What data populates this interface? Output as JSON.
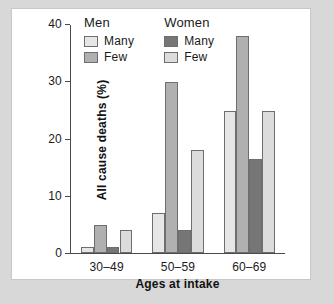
{
  "chart_data": {
    "type": "bar",
    "title": "",
    "subtitle": "",
    "xlabel": "Ages at intake",
    "ylabel": "All cause deaths (%)",
    "categories": [
      "30–49",
      "50–59",
      "60–69"
    ],
    "ylim": [
      0,
      40
    ],
    "yticks": [
      0,
      10,
      20,
      30,
      40
    ],
    "ytick_labels": [
      "0",
      "10",
      "20",
      "30",
      "40"
    ],
    "grid": false,
    "legend_position": "top-left-inside",
    "series": [
      {
        "name": "Men Many",
        "group": "Men",
        "label": "Many",
        "color": "#e6e6e6",
        "values": [
          1,
          7,
          25
        ]
      },
      {
        "name": "Men Few",
        "group": "Men",
        "label": "Few",
        "color": "#b0b0b0",
        "values": [
          5,
          30,
          38
        ]
      },
      {
        "name": "Women Many",
        "group": "Women",
        "label": "Many",
        "color": "#767676",
        "values": [
          1,
          4,
          16.5
        ]
      },
      {
        "name": "Women Few",
        "group": "Women",
        "label": "Few",
        "color": "#dcdcdc",
        "values": [
          4,
          18,
          25
        ]
      }
    ],
    "legend_groups": [
      {
        "title": "Men",
        "items": [
          {
            "label": "Many",
            "color": "#e6e6e6"
          },
          {
            "label": "Few",
            "color": "#b0b0b0"
          }
        ]
      },
      {
        "title": "Women",
        "items": [
          {
            "label": "Many",
            "color": "#767676"
          },
          {
            "label": "Few",
            "color": "#dcdcdc"
          }
        ]
      }
    ],
    "bar_edge_color": "#6e6e6e",
    "axis_color": "#4a4a4a",
    "background_color": "#ffffff"
  }
}
